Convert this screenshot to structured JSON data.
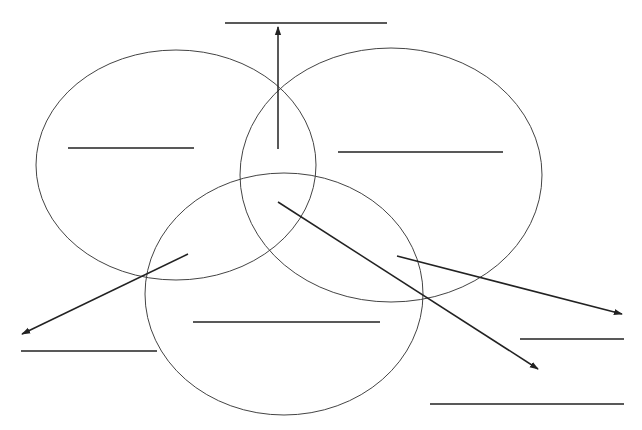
{
  "diagram": {
    "type": "venn-worksheet",
    "background": "#ffffff",
    "stroke_color": "#222222",
    "circle_color": "#444444",
    "circles": [
      {
        "id": "left",
        "cx": 176,
        "cy": 165,
        "rx": 140,
        "ry": 115
      },
      {
        "id": "right",
        "cx": 391,
        "cy": 175,
        "rx": 151,
        "ry": 127
      },
      {
        "id": "bottom",
        "cx": 284,
        "cy": 294,
        "rx": 139,
        "ry": 121
      }
    ],
    "answer_lines": [
      {
        "id": "top",
        "x1": 225,
        "y1": 23,
        "x2": 387,
        "y2": 23,
        "label": ""
      },
      {
        "id": "left-circle",
        "x1": 68,
        "y1": 148,
        "x2": 194,
        "y2": 148,
        "label": ""
      },
      {
        "id": "right-circle",
        "x1": 338,
        "y1": 152,
        "x2": 503,
        "y2": 152,
        "label": ""
      },
      {
        "id": "bottom-circle",
        "x1": 193,
        "y1": 322,
        "x2": 380,
        "y2": 322,
        "label": ""
      },
      {
        "id": "outer-left",
        "x1": 21,
        "y1": 351,
        "x2": 157,
        "y2": 351,
        "label": ""
      },
      {
        "id": "outer-right-upper",
        "x1": 520,
        "y1": 339,
        "x2": 624,
        "y2": 339,
        "label": ""
      },
      {
        "id": "outer-right-lower",
        "x1": 430,
        "y1": 404,
        "x2": 624,
        "y2": 404,
        "label": ""
      }
    ],
    "arrows": [
      {
        "id": "to-top",
        "x1": 278,
        "y1": 149,
        "x2": 278,
        "y2": 27
      },
      {
        "id": "to-outer-left",
        "x1": 188,
        "y1": 254,
        "x2": 22,
        "y2": 334
      },
      {
        "id": "to-outer-right-upper",
        "x1": 397,
        "y1": 256,
        "x2": 622,
        "y2": 314
      },
      {
        "id": "to-outer-right-lower",
        "x1": 278,
        "y1": 202,
        "x2": 538,
        "y2": 369
      }
    ]
  }
}
